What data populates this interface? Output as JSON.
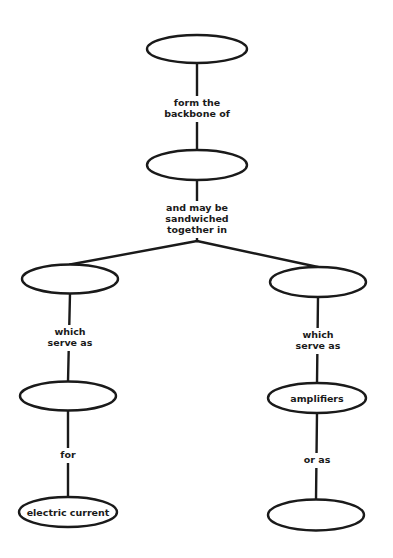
{
  "diagram": {
    "type": "concept-map",
    "colors": {
      "stroke": "#1a1a1a",
      "background": "#ffffff",
      "text": "#1a1a1a"
    },
    "nodes": [
      {
        "id": "n1",
        "label": "",
        "cx": 197,
        "cy": 49,
        "rx": 50,
        "ry": 14
      },
      {
        "id": "n2",
        "label": "",
        "cx": 197,
        "cy": 165,
        "rx": 50,
        "ry": 15
      },
      {
        "id": "n3",
        "label": "",
        "cx": 70,
        "cy": 279,
        "rx": 48,
        "ry": 14.5
      },
      {
        "id": "n4",
        "label": "",
        "cx": 318,
        "cy": 282,
        "rx": 48,
        "ry": 15
      },
      {
        "id": "n5",
        "label": "",
        "cx": 68,
        "cy": 396,
        "rx": 48,
        "ry": 14.5
      },
      {
        "id": "n6",
        "label": "amplifiers",
        "cx": 317,
        "cy": 398,
        "rx": 49,
        "ry": 15
      },
      {
        "id": "n7",
        "label": "electric current",
        "cx": 68,
        "cy": 512,
        "rx": 49,
        "ry": 15
      },
      {
        "id": "n8",
        "label": "",
        "cx": 316,
        "cy": 515,
        "rx": 48,
        "ry": 15.5
      }
    ],
    "links": [
      {
        "id": "l1",
        "from": "n1",
        "to": "n2",
        "lines": [
          "form the",
          "backbone of"
        ],
        "label_x": 197,
        "label_y": 99
      },
      {
        "id": "l2",
        "from": "n2",
        "to": [
          "n3",
          "n4"
        ],
        "lines": [
          "and may be",
          "sandwiched",
          "together in"
        ],
        "label_x": 197,
        "label_y": 204
      },
      {
        "id": "l3",
        "from": "n3",
        "to": "n5",
        "lines": [
          "which",
          "serve as"
        ],
        "label_x": 70,
        "label_y": 328
      },
      {
        "id": "l4",
        "from": "n4",
        "to": "n6",
        "lines": [
          "which",
          "serve as"
        ],
        "label_x": 318,
        "label_y": 331
      },
      {
        "id": "l5",
        "from": "n5",
        "to": "n7",
        "lines": [
          "for"
        ],
        "label_x": 68,
        "label_y": 451
      },
      {
        "id": "l6",
        "from": "n6",
        "to": "n8",
        "lines": [
          "or as"
        ],
        "label_x": 317,
        "label_y": 456
      }
    ]
  }
}
